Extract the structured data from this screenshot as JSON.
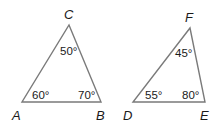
{
  "diagram": {
    "triangles": [
      {
        "name": "ABC",
        "vertices": {
          "A": {
            "label": "A",
            "angle": "60°"
          },
          "B": {
            "label": "B",
            "angle": "70°"
          },
          "C": {
            "label": "C",
            "angle": "50°"
          }
        }
      },
      {
        "name": "DEF",
        "vertices": {
          "D": {
            "label": "D",
            "angle": "55°"
          },
          "E": {
            "label": "E",
            "angle": "80°"
          },
          "F": {
            "label": "F",
            "angle": "45°"
          }
        }
      }
    ],
    "colors": {
      "edge": "#7a7a7a",
      "text": "#1a1a1a",
      "background": "#ffffff"
    }
  }
}
